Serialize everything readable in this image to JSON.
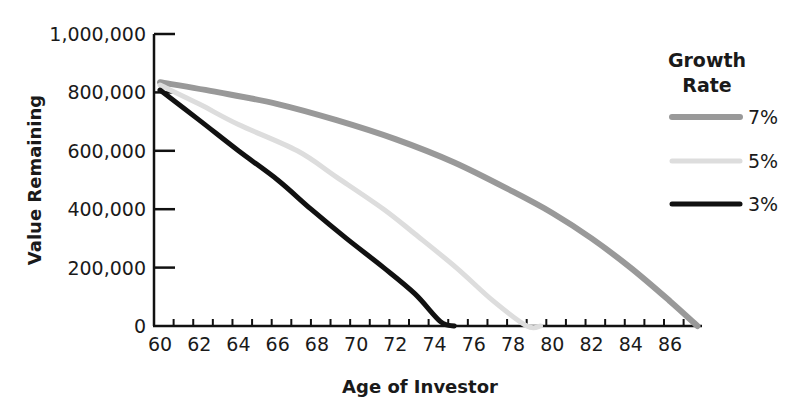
{
  "title_fragment": "...g ... , y",
  "chart_data": {
    "type": "line",
    "title": "",
    "xlabel": "Age of Investor",
    "ylabel": "Value Remaining",
    "xlim": [
      60,
      88
    ],
    "ylim": [
      0,
      1000000
    ],
    "x_ticks": [
      60,
      62,
      64,
      66,
      68,
      70,
      72,
      74,
      76,
      78,
      80,
      82,
      84,
      86
    ],
    "x_minor_ticks_every": 1,
    "y_ticks": [
      0,
      200000,
      400000,
      600000,
      800000,
      1000000
    ],
    "y_tick_labels": [
      "0",
      "200,000",
      "400,000",
      "600,000",
      "800,000",
      "1,000,000"
    ],
    "grid": false,
    "legend": {
      "title_line1": "Growth",
      "title_line2": "Rate",
      "position": "right"
    },
    "series": [
      {
        "name": "7%",
        "color": "#999999",
        "width": 6,
        "points": [
          [
            60,
            835000
          ],
          [
            63,
            800000
          ],
          [
            66,
            760000
          ],
          [
            69,
            705000
          ],
          [
            72,
            640000
          ],
          [
            75,
            560000
          ],
          [
            78,
            460000
          ],
          [
            80,
            387000
          ],
          [
            82,
            300000
          ],
          [
            84,
            199000
          ],
          [
            86,
            85000
          ],
          [
            87.4,
            0
          ]
        ]
      },
      {
        "name": "5%",
        "color": "#dddddd",
        "width": 5,
        "points": [
          [
            60,
            825000
          ],
          [
            62,
            760000
          ],
          [
            64,
            690000
          ],
          [
            67,
            600000
          ],
          [
            69,
            510000
          ],
          [
            71.4,
            400000
          ],
          [
            73,
            315000
          ],
          [
            75.1,
            200000
          ],
          [
            77,
            85000
          ],
          [
            78.7,
            0
          ],
          [
            79.4,
            0
          ]
        ]
      },
      {
        "name": "3%",
        "color": "#111111",
        "width": 5,
        "points": [
          [
            60,
            808000
          ],
          [
            62,
            705000
          ],
          [
            64,
            600000
          ],
          [
            66,
            500000
          ],
          [
            67.7,
            400000
          ],
          [
            69.5,
            300000
          ],
          [
            71.4,
            200000
          ],
          [
            73,
            110000
          ],
          [
            74.3,
            15000
          ],
          [
            75,
            0
          ]
        ]
      }
    ]
  }
}
